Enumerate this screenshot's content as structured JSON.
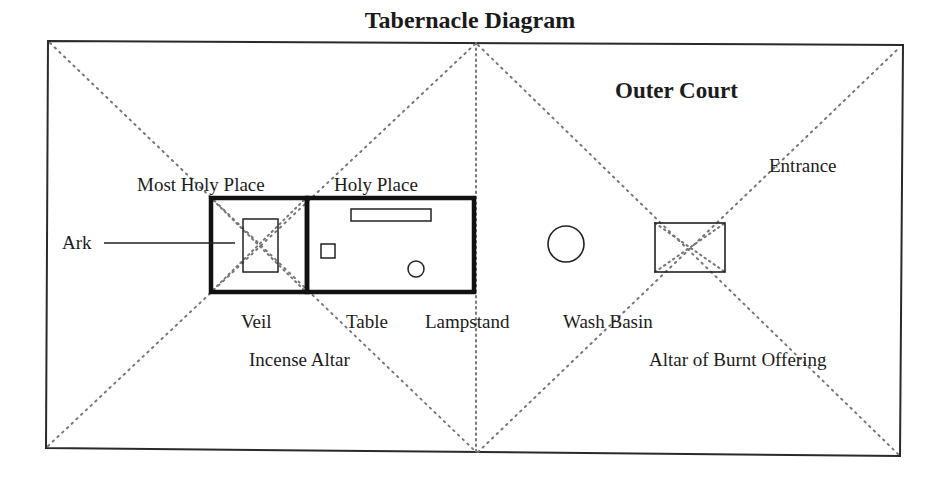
{
  "title": "Tabernacle Diagram",
  "regions": {
    "outer_court": "Outer Court",
    "most_holy_place": "Most Holy Place",
    "holy_place": "Holy Place"
  },
  "labels": {
    "ark": "Ark",
    "entrance": "Entrance",
    "veil": "Veil",
    "table": "Table",
    "lampstand": "Lampstand",
    "wash_basin": "Wash Basin",
    "incense_altar": "Incense Altar",
    "altar_of_burnt_offering": "Altar of Burnt Offering"
  },
  "colors": {
    "stroke": "#1a1a1a",
    "dotted": "#777777",
    "background": "#ffffff"
  }
}
